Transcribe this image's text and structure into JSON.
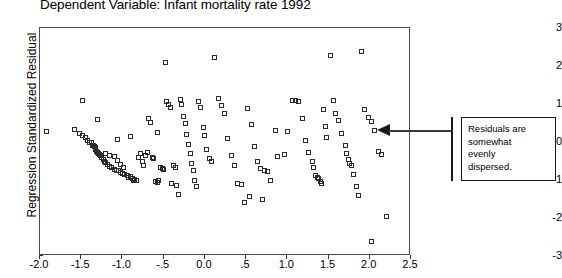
{
  "chart_data": {
    "type": "scatter",
    "title": "Dependent Variable: Infant mortality rate 1992",
    "xlabel": "",
    "ylabel": "Regression Standardized Residual",
    "xlim": [
      -2.0,
      2.5
    ],
    "ylim": [
      -3,
      3
    ],
    "grid": false,
    "legend": null,
    "x_ticks": [
      "-2.0",
      "-1.5",
      "-1.0",
      "-.5",
      "0.0",
      ".5",
      "1.0",
      "1.5",
      "2.0",
      "2.5"
    ],
    "x_tick_values": [
      -2.0,
      -1.5,
      -1.0,
      -0.5,
      0.0,
      0.5,
      1.0,
      1.5,
      2.0,
      2.5
    ],
    "y_ticks": [
      "3",
      "2",
      "1",
      "0",
      "-1",
      "-2",
      "-3"
    ],
    "y_tick_values": [
      3,
      2,
      1,
      0,
      -1,
      -2,
      -3
    ],
    "marker": "open-square",
    "marker_color": "#2b2b2b",
    "points": [
      [
        -1.58,
        0.34
      ],
      [
        -1.52,
        0.22
      ],
      [
        -1.49,
        0.17
      ],
      [
        -1.45,
        0.13
      ],
      [
        -1.42,
        0.04
      ],
      [
        -1.4,
        -0.02
      ],
      [
        -1.38,
        0.0
      ],
      [
        -1.36,
        -0.08
      ],
      [
        -1.35,
        -0.1
      ],
      [
        -1.34,
        -0.13
      ],
      [
        -1.33,
        -0.14
      ],
      [
        -1.33,
        -0.2
      ],
      [
        -1.31,
        -0.24
      ],
      [
        -1.3,
        -0.28
      ],
      [
        -1.29,
        -0.3
      ],
      [
        -1.28,
        -0.34
      ],
      [
        -1.27,
        -0.36
      ],
      [
        -1.25,
        -0.41
      ],
      [
        -1.23,
        -0.45
      ],
      [
        -1.22,
        -0.5
      ],
      [
        -1.2,
        -0.55
      ],
      [
        -1.18,
        -0.6
      ],
      [
        -1.16,
        -0.64
      ],
      [
        -1.13,
        -0.68
      ],
      [
        -1.1,
        -0.72
      ],
      [
        -1.07,
        -0.74
      ],
      [
        -1.05,
        -0.76
      ],
      [
        -1.02,
        -0.8
      ],
      [
        -1.0,
        -0.84
      ],
      [
        -0.97,
        -0.86
      ],
      [
        -0.94,
        -0.88
      ],
      [
        -1.48,
        1.1
      ],
      [
        -1.3,
        0.58
      ],
      [
        -1.21,
        -0.3
      ],
      [
        -1.16,
        -0.35
      ],
      [
        -1.1,
        -0.38
      ],
      [
        -1.06,
        -0.48
      ],
      [
        -1.02,
        -0.6
      ],
      [
        -0.99,
        -0.66
      ],
      [
        -0.93,
        -0.94
      ],
      [
        -0.9,
        -0.92
      ],
      [
        -0.88,
        -0.95
      ],
      [
        -0.86,
        -1.02
      ],
      [
        -0.85,
        -0.98
      ],
      [
        -0.83,
        -1.0
      ],
      [
        -0.8,
        -0.42
      ],
      [
        -0.78,
        -0.3
      ],
      [
        -0.76,
        -0.5
      ],
      [
        -0.74,
        -0.62
      ],
      [
        -0.72,
        -0.36
      ],
      [
        -0.7,
        -0.28
      ],
      [
        -0.68,
        0.62
      ],
      [
        -0.66,
        0.52
      ],
      [
        -0.64,
        -0.4
      ],
      [
        -0.62,
        -0.44
      ],
      [
        -0.6,
        -1.04
      ],
      [
        -0.58,
        -1.06
      ],
      [
        -0.56,
        -1.0
      ],
      [
        -0.54,
        -0.66
      ],
      [
        -0.52,
        -0.7
      ],
      [
        -0.5,
        -0.72
      ],
      [
        -0.48,
        2.1
      ],
      [
        -0.46,
        1.06
      ],
      [
        -0.44,
        0.98
      ],
      [
        -0.42,
        0.92
      ],
      [
        -0.4,
        -1.1
      ],
      [
        -0.38,
        -0.62
      ],
      [
        -0.36,
        -0.68
      ],
      [
        -0.34,
        -1.14
      ],
      [
        -0.32,
        -1.38
      ],
      [
        -0.3,
        1.12
      ],
      [
        -0.28,
        1.0
      ],
      [
        -0.26,
        0.66
      ],
      [
        -0.24,
        0.48
      ],
      [
        -0.22,
        0.2
      ],
      [
        -0.2,
        -0.06
      ],
      [
        -0.18,
        -0.3
      ],
      [
        -0.16,
        -0.56
      ],
      [
        -0.14,
        -0.74
      ],
      [
        -0.12,
        -1.02
      ],
      [
        -0.1,
        -1.16
      ],
      [
        -0.08,
        1.06
      ],
      [
        -0.05,
        0.9
      ],
      [
        -0.02,
        0.38
      ],
      [
        0.0,
        0.18
      ],
      [
        0.02,
        -0.2
      ],
      [
        0.05,
        -0.44
      ],
      [
        0.08,
        -0.52
      ],
      [
        0.12,
        2.22
      ],
      [
        0.16,
        1.14
      ],
      [
        0.2,
        0.96
      ],
      [
        0.24,
        0.74
      ],
      [
        0.28,
        0.1
      ],
      [
        0.32,
        -0.36
      ],
      [
        0.36,
        -0.62
      ],
      [
        0.4,
        -1.08
      ],
      [
        0.44,
        -1.12
      ],
      [
        0.48,
        -1.6
      ],
      [
        0.52,
        0.88
      ],
      [
        0.56,
        0.46
      ],
      [
        0.6,
        -0.12
      ],
      [
        0.64,
        -0.5
      ],
      [
        0.68,
        -0.7
      ],
      [
        0.72,
        -0.74
      ],
      [
        0.76,
        -0.78
      ],
      [
        0.8,
        -1.02
      ],
      [
        0.88,
        -0.38
      ],
      [
        0.96,
        -0.32
      ],
      [
        1.06,
        1.1
      ],
      [
        1.1,
        1.08
      ],
      [
        1.14,
        1.06
      ],
      [
        1.18,
        0.62
      ],
      [
        1.22,
        0.04
      ],
      [
        1.26,
        -0.28
      ],
      [
        1.3,
        -0.52
      ],
      [
        1.32,
        -0.66
      ],
      [
        1.34,
        -0.88
      ],
      [
        1.36,
        -0.94
      ],
      [
        1.38,
        -0.96
      ],
      [
        1.4,
        -1.04
      ],
      [
        1.42,
        -1.08
      ],
      [
        1.44,
        0.86
      ],
      [
        1.46,
        0.42
      ],
      [
        1.48,
        0.12
      ],
      [
        1.52,
        2.28
      ],
      [
        1.56,
        1.08
      ],
      [
        1.58,
        0.76
      ],
      [
        1.62,
        0.56
      ],
      [
        1.66,
        0.22
      ],
      [
        1.7,
        -0.08
      ],
      [
        1.72,
        -0.3
      ],
      [
        1.74,
        -0.46
      ],
      [
        1.76,
        -0.56
      ],
      [
        1.78,
        -0.62
      ],
      [
        1.8,
        -0.86
      ],
      [
        1.84,
        -1.18
      ],
      [
        1.86,
        -1.42
      ],
      [
        1.9,
        2.38
      ],
      [
        1.94,
        0.86
      ],
      [
        1.98,
        0.64
      ],
      [
        2.02,
        0.54
      ],
      [
        2.06,
        0.3
      ],
      [
        2.1,
        -0.26
      ],
      [
        2.14,
        -0.34
      ],
      [
        2.2,
        -1.96
      ],
      [
        2.02,
        -2.62
      ],
      [
        -1.92,
        0.28
      ],
      [
        0.54,
        -1.44
      ],
      [
        0.7,
        -1.5
      ],
      [
        1.0,
        0.28
      ],
      [
        0.86,
        0.3
      ],
      [
        -0.58,
        0.26
      ],
      [
        -0.9,
        0.14
      ],
      [
        -1.06,
        0.06
      ]
    ]
  },
  "annotation": {
    "lines": [
      "Residuals are",
      "somewhat",
      "evenly",
      "dispersed."
    ]
  }
}
